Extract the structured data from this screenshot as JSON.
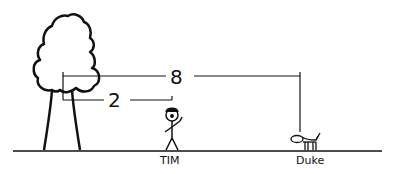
{
  "diagram": {
    "labels": {
      "person": "TIM",
      "dog": "Duke"
    },
    "measurements": {
      "tree_to_tim": "2",
      "tree_to_duke": "8"
    },
    "objects": [
      "tree",
      "stick-figure-person",
      "dog",
      "ground-line"
    ],
    "colors": {
      "stroke": "#111111",
      "background": "#ffffff"
    }
  }
}
